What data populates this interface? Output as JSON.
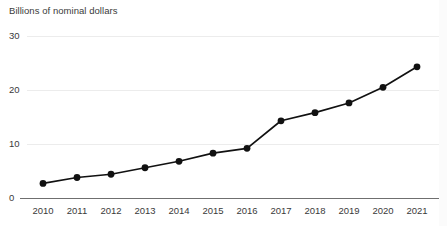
{
  "chart_data": {
    "type": "line",
    "title": "",
    "subtitle": "",
    "ylabel": "Billions of nominal dollars",
    "xlabel": "",
    "categories": [
      "2010",
      "2011",
      "2012",
      "2013",
      "2014",
      "2015",
      "2016",
      "2017",
      "2018",
      "2019",
      "2020",
      "2021"
    ],
    "x": [
      2010,
      2011,
      2012,
      2013,
      2014,
      2015,
      2016,
      2017,
      2018,
      2019,
      2020,
      2021
    ],
    "values": [
      2.7,
      3.8,
      4.4,
      5.6,
      6.8,
      8.3,
      9.2,
      14.3,
      15.8,
      17.6,
      20.5,
      24.3
    ],
    "series": [
      {
        "name": "Billions of nominal dollars",
        "values": [
          2.7,
          3.8,
          4.4,
          5.6,
          6.8,
          8.3,
          9.2,
          14.3,
          15.8,
          17.6,
          20.5,
          24.3
        ],
        "color": "#111111",
        "marker": "circle"
      }
    ],
    "ylim": [
      0,
      30
    ],
    "yticks": [
      0,
      10,
      20,
      30
    ],
    "ytick_labels": [
      "0",
      "10",
      "20",
      "30"
    ],
    "xtick_labels": [
      "2010",
      "2011",
      "2012",
      "2013",
      "2014",
      "2015",
      "2016",
      "2017",
      "2018",
      "2019",
      "2020",
      "2021"
    ],
    "grid": true,
    "grid_color": "#ececec",
    "legend": false,
    "legend_position": "none",
    "axis_color": "#6f6f6f",
    "background": "#ffffff",
    "annotations": []
  },
  "axis": {
    "y_title": "Billions of nominal dollars"
  },
  "ticks": {
    "y": [
      {
        "label": "30"
      },
      {
        "label": "20"
      },
      {
        "label": "10"
      },
      {
        "label": "0"
      }
    ],
    "x": [
      {
        "label": "2010"
      },
      {
        "label": "2011"
      },
      {
        "label": "2012"
      },
      {
        "label": "2013"
      },
      {
        "label": "2014"
      },
      {
        "label": "2015"
      },
      {
        "label": "2016"
      },
      {
        "label": "2017"
      },
      {
        "label": "2018"
      },
      {
        "label": "2019"
      },
      {
        "label": "2020"
      },
      {
        "label": "2021"
      }
    ]
  }
}
